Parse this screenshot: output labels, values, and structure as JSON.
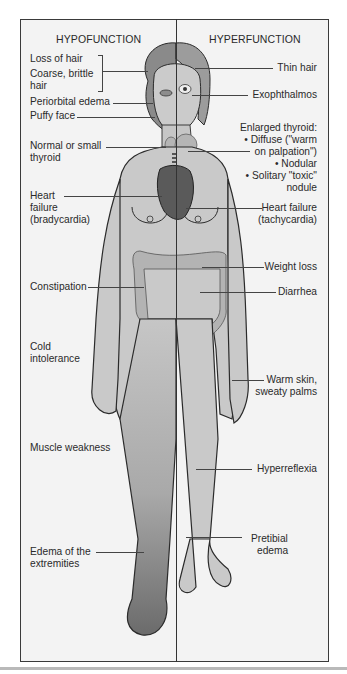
{
  "diagram": {
    "type": "anatomical-comparison",
    "columns": {
      "left_header": "HYPOFUNCTION",
      "right_header": "HYPERFUNCTION"
    },
    "hypofunction_labels": [
      {
        "id": "loss-of-hair",
        "text": "Loss of hair"
      },
      {
        "id": "coarse-hair-1",
        "text": "Coarse, brittle"
      },
      {
        "id": "coarse-hair-2",
        "text": "hair"
      },
      {
        "id": "periorbital-edema",
        "text": "Periorbital edema"
      },
      {
        "id": "puffy-face",
        "text": "Puffy face"
      },
      {
        "id": "small-thyroid-1",
        "text": "Normal or small"
      },
      {
        "id": "small-thyroid-2",
        "text": "thyroid"
      },
      {
        "id": "heart-failure-1",
        "text": "Heart"
      },
      {
        "id": "heart-failure-2",
        "text": "failure"
      },
      {
        "id": "heart-failure-3",
        "text": "(bradycardia)"
      },
      {
        "id": "constipation",
        "text": "Constipation"
      },
      {
        "id": "cold-1",
        "text": "Cold"
      },
      {
        "id": "cold-2",
        "text": "intolerance"
      },
      {
        "id": "muscle-weakness",
        "text": "Muscle weakness"
      },
      {
        "id": "edema-ext-1",
        "text": "Edema of the"
      },
      {
        "id": "edema-ext-2",
        "text": "extremities"
      }
    ],
    "hyperfunction_labels": [
      {
        "id": "thin-hair",
        "text": "Thin hair"
      },
      {
        "id": "exophthalmos",
        "text": "Exophthalmos"
      },
      {
        "id": "enlarged-thyroid",
        "text": "Enlarged thyroid:"
      },
      {
        "id": "diffuse-1",
        "text": "• Diffuse (\"warm"
      },
      {
        "id": "diffuse-2",
        "text": "on palpation\")"
      },
      {
        "id": "nodular",
        "text": "• Nodular"
      },
      {
        "id": "solitary-1",
        "text": "• Solitary \"toxic\""
      },
      {
        "id": "solitary-2",
        "text": "nodule"
      },
      {
        "id": "hf-tachy-1",
        "text": "Heart failure"
      },
      {
        "id": "hf-tachy-2",
        "text": "(tachycardia)"
      },
      {
        "id": "weight-loss",
        "text": "Weight loss"
      },
      {
        "id": "diarrhea",
        "text": "Diarrhea"
      },
      {
        "id": "warm-skin-1",
        "text": "Warm skin,"
      },
      {
        "id": "warm-skin-2",
        "text": "sweaty palms"
      },
      {
        "id": "hyperreflexia",
        "text": "Hyperreflexia"
      },
      {
        "id": "pretibial-1",
        "text": "Pretibial"
      },
      {
        "id": "pretibial-2",
        "text": "edema"
      }
    ],
    "colors": {
      "frame_bg": "#f3f3f3",
      "skin": "#c9c9c9",
      "outline": "#2b2b2b",
      "heart": "#5a5a5a",
      "colon": "#b3b3b3",
      "edema_leg_dark": "#6e6e6e"
    }
  }
}
